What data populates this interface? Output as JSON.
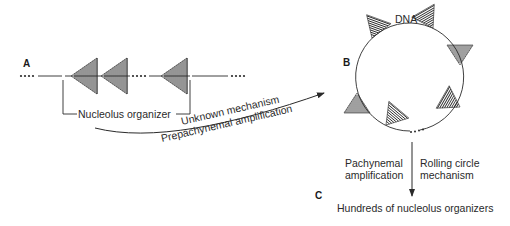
{
  "diagram": {
    "type": "biological-process-diagram",
    "panels": {
      "A": {
        "label": "A",
        "bracket_label": "Nucleolus organizer"
      },
      "B": {
        "label": "B",
        "circle_label": "DNA"
      },
      "C": {
        "label": "C",
        "result_label": "Hundreds of nucleolus organizers"
      }
    },
    "transitions": [
      {
        "from": "A",
        "to": "B",
        "label_above": "Unknown mechanism",
        "label_below": "Prepachynemal amplification"
      },
      {
        "from": "B",
        "to": "C",
        "label_left_line1": "Pachynemal",
        "label_left_line2": "amplification",
        "label_right_line1": "Rolling circle",
        "label_right_line2": "mechanism"
      }
    ],
    "colors": {
      "ink": "#2a2a2a",
      "background": "#ffffff"
    }
  }
}
